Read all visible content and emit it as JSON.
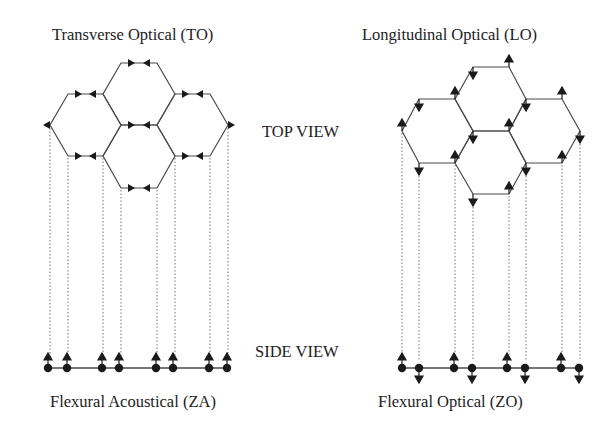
{
  "labels": {
    "to": "Transverse Optical (TO)",
    "lo": "Longitudinal Optical (LO)",
    "za": "Flexural Acoustical (ZA)",
    "zo": "Flexural Optical (ZO)",
    "top_view": "TOP VIEW",
    "side_view": "SIDE VIEW"
  },
  "colors": {
    "line": "#4a4a4a",
    "arrow": "#1a1a1a",
    "dotted": "#777777",
    "text": "#222222"
  },
  "diagram": {
    "to_lattice": {
      "xs": [
        50,
        68,
        103,
        121,
        157,
        175,
        210,
        228
      ],
      "ys": [
        63,
        94,
        125,
        156,
        188
      ],
      "in_plane_arrows": "horizontal, pointing toward each other along each horizontal bond; outer vertices point outward"
    },
    "lo_lattice": {
      "xs": [
        402,
        419,
        455,
        473,
        509,
        526,
        562,
        580
      ],
      "ys": [
        67,
        99,
        131,
        163,
        194
      ],
      "in_plane_arrows": "vertical (up/down) alternating at bond ends"
    },
    "za_side": {
      "xs": [
        48,
        67,
        102,
        119,
        156,
        173,
        209,
        227
      ],
      "y": 368,
      "displacement": [
        "up",
        "up",
        "up",
        "up",
        "up",
        "up",
        "up",
        "up"
      ]
    },
    "zo_side": {
      "xs": [
        402,
        419,
        454,
        472,
        507,
        525,
        561,
        579
      ],
      "y": 368,
      "displacement": [
        "up",
        "down",
        "up",
        "down",
        "up",
        "down",
        "up",
        "down"
      ]
    }
  }
}
